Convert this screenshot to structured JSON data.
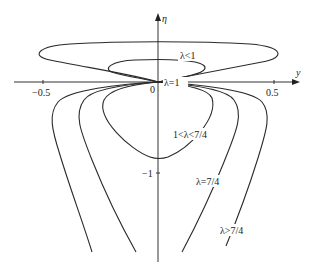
{
  "axes": {
    "x_label": "y",
    "y_label": "η",
    "origin_label": "0",
    "x_ticks": [
      "−0.5",
      "0.5"
    ],
    "y_ticks": [
      "−1"
    ]
  },
  "curve_labels": {
    "lambda_lt_1": "λ<1",
    "lambda_eq_1": "λ=1",
    "lambda_between": "1<λ<7/4",
    "lambda_eq_7_4": "λ=7/4",
    "lambda_gt_7_4": "λ>7/4"
  },
  "colors": {
    "stroke": "#2a2a2a",
    "background": "#ffffff"
  }
}
